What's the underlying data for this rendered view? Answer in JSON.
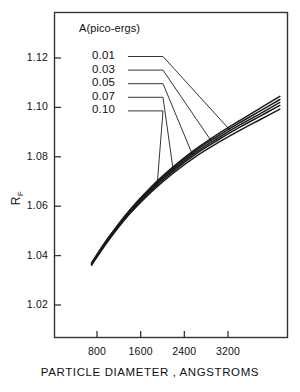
{
  "chart_data": {
    "type": "line",
    "title": "",
    "xlabel": "PARTICLE  DIAMETER ,  ANGSTROMS",
    "ylabel": "R",
    "ylabel_sub": "F",
    "legend_title": "A(pico-ergs)",
    "legend_position": "upper-left-inside",
    "grid": false,
    "xlim": [
      0,
      4000
    ],
    "ylim": [
      1.01,
      1.132
    ],
    "xticks": [
      800,
      1600,
      2400,
      3200
    ],
    "xtick_labels": [
      "800",
      "1600",
      "2400",
      "3200"
    ],
    "yticks": [
      1.02,
      1.04,
      1.06,
      1.08,
      1.1,
      1.12
    ],
    "ytick_labels": [
      "1.02",
      "1.04",
      "1.06",
      "1.08",
      "1.10",
      "1.12"
    ],
    "series": [
      {
        "name": "0.01",
        "x": [
          700,
          1000,
          1400,
          1800,
          2200,
          2600,
          3000,
          3400,
          3800,
          4150
        ],
        "values": [
          1.037,
          1.047,
          1.0585,
          1.068,
          1.076,
          1.083,
          1.089,
          1.0945,
          1.0998,
          1.1045
        ]
      },
      {
        "name": "0.03",
        "x": [
          700,
          1000,
          1400,
          1800,
          2200,
          2600,
          3000,
          3400,
          3800,
          4150
        ],
        "values": [
          1.0368,
          1.0468,
          1.0582,
          1.0676,
          1.0755,
          1.0824,
          1.0882,
          1.0936,
          1.0987,
          1.1032
        ]
      },
      {
        "name": "0.05",
        "x": [
          700,
          1000,
          1400,
          1800,
          2200,
          2600,
          3000,
          3400,
          3800,
          4150
        ],
        "values": [
          1.0366,
          1.0465,
          1.0578,
          1.0671,
          1.0749,
          1.0817,
          1.0874,
          1.0927,
          1.0976,
          1.102
        ]
      },
      {
        "name": "0.07",
        "x": [
          700,
          1000,
          1400,
          1800,
          2200,
          2600,
          3000,
          3400,
          3800,
          4150
        ],
        "values": [
          1.0364,
          1.0462,
          1.0574,
          1.0666,
          1.0743,
          1.081,
          1.0866,
          1.0918,
          1.0966,
          1.1008
        ]
      },
      {
        "name": "0.10",
        "x": [
          700,
          1000,
          1400,
          1800,
          2200,
          2600,
          3000,
          3400,
          3800,
          4150
        ],
        "values": [
          1.0361,
          1.0458,
          1.0569,
          1.0659,
          1.0735,
          1.08,
          1.0855,
          1.0905,
          1.0952,
          1.0993
        ]
      }
    ],
    "legend_entries": [
      {
        "label": "0.01",
        "leader_to_x": 3250,
        "leader_to_y": 1.0905
      },
      {
        "label": "0.03",
        "leader_to_x": 2900,
        "leader_to_y": 1.0862
      },
      {
        "label": "0.05",
        "leader_to_x": 2550,
        "leader_to_y": 1.0808
      },
      {
        "label": "0.07",
        "leader_to_x": 2200,
        "leader_to_y": 1.074
      },
      {
        "label": "0.10",
        "leader_to_x": 1900,
        "leader_to_y": 1.0678
      }
    ]
  },
  "colors": {
    "ink": "#111111",
    "frame": "#333333",
    "curve": "#1a1a1a",
    "background": "#ffffff"
  }
}
